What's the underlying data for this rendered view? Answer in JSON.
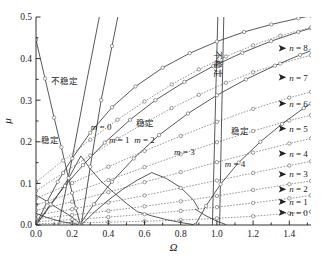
{
  "chart_data": {
    "type": "line",
    "title": "",
    "xlabel": "Ω",
    "ylabel": "μ",
    "xlim": [
      0.0,
      1.52
    ],
    "ylim": [
      0.0,
      0.5
    ],
    "grid": false,
    "legend_position": "inline-annotations",
    "xticks": [
      0.0,
      0.2,
      0.4,
      0.6,
      0.8,
      1.0,
      1.2,
      1.4
    ],
    "xtick_labels": [
      "0.0",
      "0.2",
      "0.4",
      "0.6",
      "0.8",
      "1.0",
      "1.2",
      "1.4"
    ],
    "xticks_minor": [
      0.1,
      0.3,
      0.5,
      0.7,
      0.9,
      1.1,
      1.3,
      1.5
    ],
    "yticks": [
      0.0,
      0.1,
      0.2,
      0.3,
      0.4,
      0.5
    ],
    "ytick_labels": [
      "0.0",
      "0.1",
      "0.2",
      "0.3",
      "0.4",
      "0.5"
    ],
    "yticks_minor": [
      0.05,
      0.15,
      0.25,
      0.35,
      0.45
    ],
    "region_labels": [
      {
        "text": "不稳定",
        "x": 0.16,
        "y": 0.345,
        "rotate": 0
      },
      {
        "text": "稳定",
        "x": 0.08,
        "y": 0.205,
        "rotate": 0
      },
      {
        "text": "稳定",
        "x": 0.6,
        "y": 0.245,
        "rotate": 0
      },
      {
        "text": "稳定",
        "x": 1.13,
        "y": 0.225,
        "rotate": 0
      },
      {
        "text": "不稳定",
        "x": 1.005,
        "y": 0.385,
        "rotate": 90
      }
    ],
    "mode_labels": [
      {
        "text": "m = 0",
        "x": 0.36,
        "y": 0.237
      },
      {
        "text": "m = 1",
        "x": 0.46,
        "y": 0.205
      },
      {
        "text": "m = 2",
        "x": 0.6,
        "y": 0.205
      },
      {
        "text": "m = 3",
        "x": 0.82,
        "y": 0.175
      },
      {
        "text": "m = 4",
        "x": 1.1,
        "y": 0.148
      }
    ],
    "n_labels": [
      {
        "text": "n = 8",
        "x": 1.4,
        "y": 0.425
      },
      {
        "text": "n = 7",
        "x": 1.4,
        "y": 0.355
      },
      {
        "text": "n = 6",
        "x": 1.4,
        "y": 0.292
      },
      {
        "text": "n = 5",
        "x": 1.4,
        "y": 0.232
      },
      {
        "text": "n = 4",
        "x": 1.4,
        "y": 0.172
      },
      {
        "text": "n = 3",
        "x": 1.4,
        "y": 0.122
      },
      {
        "text": "n = 2",
        "x": 1.4,
        "y": 0.086
      },
      {
        "text": "n = 1",
        "x": 1.4,
        "y": 0.056
      },
      {
        "text": "n = 0",
        "x": 1.4,
        "y": 0.03
      }
    ],
    "series": [
      {
        "name": "m = 0",
        "style": "solid",
        "x": [
          0.0,
          0.05,
          0.1,
          0.14,
          0.18,
          0.22,
          0.245,
          0.25
        ],
        "y": [
          0.445,
          0.352,
          0.258,
          0.187,
          0.113,
          0.04,
          0.003,
          0.0
        ]
      },
      {
        "name": "m = 0 upper",
        "style": "solid",
        "x": [
          0.25,
          0.3,
          0.36,
          0.42,
          0.48,
          0.53
        ],
        "y": [
          0.0,
          0.14,
          0.3,
          0.43,
          0.56,
          0.66
        ]
      },
      {
        "name": "m = 1",
        "style": "solid",
        "x": [
          0.0,
          0.06,
          0.12,
          0.2,
          0.3,
          0.42,
          0.55,
          0.7,
          0.85,
          1.0,
          1.15,
          1.3,
          1.45,
          1.52
        ],
        "y": [
          0.0,
          0.055,
          0.104,
          0.16,
          0.222,
          0.283,
          0.333,
          0.378,
          0.413,
          0.441,
          0.464,
          0.482,
          0.497,
          0.503
        ]
      },
      {
        "name": "m = 2",
        "style": "solid",
        "x": [
          0.0,
          0.08,
          0.16,
          0.26,
          0.38,
          0.52,
          0.66,
          0.82,
          0.98,
          1.14,
          1.3,
          1.45,
          1.52
        ],
        "y": [
          0.0,
          0.05,
          0.094,
          0.144,
          0.198,
          0.253,
          0.3,
          0.344,
          0.382,
          0.414,
          0.442,
          0.464,
          0.473
        ]
      },
      {
        "name": "m = 3",
        "style": "solid",
        "x": [
          0.24,
          0.32,
          0.42,
          0.54,
          0.68,
          0.84,
          1.0,
          1.16,
          1.32,
          1.46,
          1.52
        ],
        "y": [
          0.0,
          0.05,
          0.104,
          0.16,
          0.216,
          0.268,
          0.312,
          0.35,
          0.383,
          0.409,
          0.419
        ]
      },
      {
        "name": "m = 4",
        "style": "solid",
        "x": [
          0.88,
          0.94,
          1.02,
          1.12,
          1.24,
          1.36,
          1.48,
          1.52
        ],
        "y": [
          0.0,
          0.046,
          0.098,
          0.15,
          0.2,
          0.243,
          0.281,
          0.292
        ]
      },
      {
        "name": "n = 0",
        "style": "dotted",
        "x": [
          0.0,
          0.2,
          0.4,
          0.6,
          0.8,
          1.0,
          1.2,
          1.4,
          1.52
        ],
        "y": [
          0.003,
          0.005,
          0.007,
          0.009,
          0.012,
          0.016,
          0.021,
          0.028,
          0.032
        ]
      },
      {
        "name": "n = 1",
        "style": "dotted",
        "x": [
          0.0,
          0.2,
          0.4,
          0.6,
          0.8,
          1.0,
          1.2,
          1.4,
          1.52
        ],
        "y": [
          0.008,
          0.013,
          0.019,
          0.026,
          0.034,
          0.043,
          0.053,
          0.064,
          0.071
        ]
      },
      {
        "name": "n = 2",
        "style": "dotted",
        "x": [
          0.0,
          0.2,
          0.4,
          0.6,
          0.8,
          1.0,
          1.2,
          1.4,
          1.52
        ],
        "y": [
          0.015,
          0.024,
          0.034,
          0.045,
          0.057,
          0.07,
          0.084,
          0.098,
          0.106
        ]
      },
      {
        "name": "n = 3",
        "style": "dotted",
        "x": [
          0.0,
          0.2,
          0.4,
          0.6,
          0.8,
          1.0,
          1.2,
          1.4,
          1.52
        ],
        "y": [
          0.024,
          0.038,
          0.054,
          0.071,
          0.089,
          0.107,
          0.125,
          0.143,
          0.153
        ]
      },
      {
        "name": "n = 4",
        "style": "dotted",
        "x": [
          0.0,
          0.2,
          0.4,
          0.6,
          0.8,
          1.0,
          1.2,
          1.4,
          1.52
        ],
        "y": [
          0.035,
          0.056,
          0.079,
          0.103,
          0.127,
          0.151,
          0.174,
          0.196,
          0.208
        ]
      },
      {
        "name": "n = 5",
        "style": "dotted",
        "x": [
          0.0,
          0.2,
          0.4,
          0.6,
          0.8,
          1.0,
          1.2,
          1.4,
          1.52
        ],
        "y": [
          0.048,
          0.077,
          0.108,
          0.139,
          0.17,
          0.199,
          0.226,
          0.251,
          0.264
        ]
      },
      {
        "name": "n = 6",
        "style": "dotted",
        "x": [
          0.0,
          0.2,
          0.4,
          0.6,
          0.8,
          1.0,
          1.2,
          1.4,
          1.52
        ],
        "y": [
          0.064,
          0.101,
          0.14,
          0.178,
          0.214,
          0.248,
          0.279,
          0.306,
          0.32
        ]
      },
      {
        "name": "n = 7",
        "style": "dotted",
        "x": [
          0.0,
          0.15,
          0.3,
          0.45,
          0.6,
          0.75,
          0.9,
          1.05,
          1.2,
          1.35,
          1.52
        ],
        "y": [
          0.082,
          0.125,
          0.167,
          0.207,
          0.245,
          0.281,
          0.313,
          0.342,
          0.367,
          0.388,
          0.408
        ]
      },
      {
        "name": "n = 8",
        "style": "dotted",
        "x": [
          0.0,
          0.15,
          0.3,
          0.45,
          0.6,
          0.75,
          0.9,
          1.05,
          1.2,
          1.35,
          1.52
        ],
        "y": [
          0.103,
          0.155,
          0.205,
          0.253,
          0.297,
          0.338,
          0.374,
          0.405,
          0.432,
          0.455,
          0.475
        ]
      },
      {
        "name": "steep-line-a",
        "style": "solid",
        "x": [
          0.125,
          0.2,
          0.28,
          0.35
        ],
        "y": [
          0.0,
          0.16,
          0.345,
          0.5
        ]
      },
      {
        "name": "steep-line-b",
        "style": "solid",
        "x": [
          0.975,
          0.985,
          0.995,
          1.005
        ],
        "y": [
          0.0,
          0.17,
          0.34,
          0.5
        ]
      },
      {
        "name": "steep-line-c",
        "style": "solid",
        "x": [
          1.015,
          1.022,
          1.03,
          1.038
        ],
        "y": [
          0.0,
          0.17,
          0.34,
          0.5
        ]
      },
      {
        "name": "lower-branch-1",
        "style": "solid",
        "x": [
          0.0,
          0.055,
          0.105,
          0.145,
          0.19,
          0.225,
          0.248
        ],
        "y": [
          0.0,
          0.032,
          0.062,
          0.088,
          0.12,
          0.148,
          0.166
        ]
      },
      {
        "name": "lower-branch-2",
        "style": "solid",
        "x": [
          0.0,
          0.06,
          0.12,
          0.175,
          0.225,
          0.252
        ],
        "y": [
          0.072,
          0.057,
          0.04,
          0.026,
          0.01,
          0.001
        ]
      },
      {
        "name": "lower-branch-3",
        "style": "solid",
        "x": [
          0.248,
          0.3,
          0.36,
          0.43,
          0.5,
          0.56
        ],
        "y": [
          0.166,
          0.135,
          0.105,
          0.078,
          0.052,
          0.032
        ]
      },
      {
        "name": "lower-branch-4",
        "style": "solid",
        "x": [
          0.252,
          0.32,
          0.4,
          0.48,
          0.56,
          0.64
        ],
        "y": [
          0.001,
          0.03,
          0.06,
          0.086,
          0.108,
          0.126
        ]
      },
      {
        "name": "lower-branch-5",
        "style": "solid",
        "x": [
          0.56,
          0.64,
          0.72,
          0.8,
          0.87
        ],
        "y": [
          0.032,
          0.022,
          0.013,
          0.006,
          0.001
        ]
      },
      {
        "name": "lower-branch-6",
        "style": "solid",
        "x": [
          0.64,
          0.72,
          0.8,
          0.87,
          0.9
        ],
        "y": [
          0.126,
          0.112,
          0.09,
          0.06,
          0.038
        ]
      },
      {
        "name": "lower-branch-7",
        "style": "solid",
        "x": [
          0.88,
          0.94,
          1.0,
          1.05
        ],
        "y": [
          0.038,
          0.022,
          0.009,
          0.001
        ]
      },
      {
        "name": "lower-branch-8",
        "style": "solid",
        "x": [
          0.0,
          0.06,
          0.14,
          0.24
        ],
        "y": [
          0.028,
          0.018,
          0.008,
          0.001
        ]
      }
    ]
  },
  "axes": {
    "x_title": "Ω",
    "y_title": "μ"
  }
}
